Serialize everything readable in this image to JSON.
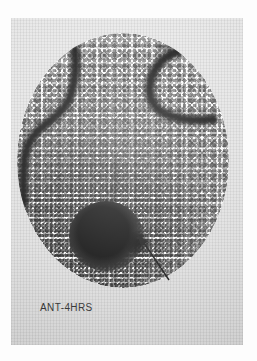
{
  "study": {
    "modality": "nuclear-medicine-scintigraphy",
    "label": "ANT-4HRS",
    "view": "ANT",
    "delay": "4HRS"
  },
  "image": {
    "frame": {
      "x": 11,
      "y": 18,
      "width": 232,
      "height": 327
    },
    "field_of_view": {
      "shape": "circle",
      "x": 6,
      "y": 15,
      "width": 212,
      "height": 255
    },
    "background_color": "#e4e4e4",
    "fov_color": "#f7f7f7",
    "ink_color": "#0a0a0a"
  },
  "findings": {
    "arrow": {
      "name": "annotation-arrow",
      "tip": {
        "x": 126,
        "y": 216
      },
      "tail": {
        "x": 158,
        "y": 262
      },
      "color": "#101010"
    },
    "hot_focus": {
      "name": "dominant-activity-focus",
      "x": 89,
      "y": 203
    },
    "secondary_focus": {
      "name": "adjacent-activity-focus",
      "x": 121,
      "y": 210
    },
    "tracer_structures": [
      {
        "name": "left-curvilinear-activity"
      },
      {
        "name": "right-curvilinear-activity"
      }
    ]
  },
  "marks": {
    "edge_tick": "fiducial-tick"
  }
}
